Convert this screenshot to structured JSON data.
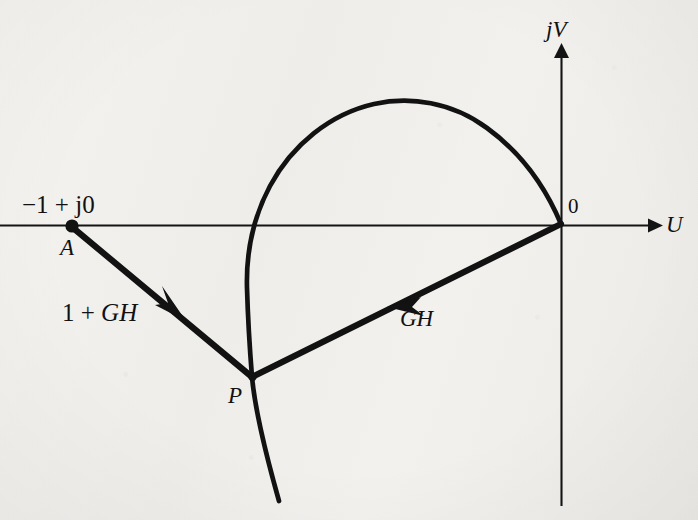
{
  "figure": {
    "kind": "nyquist-plot",
    "background_color": "#f1f0ed",
    "ink_color": "#111111"
  },
  "axes": {
    "horizontal": {
      "label": "U",
      "label_x": 666,
      "label_y": 213,
      "y": 225,
      "x_start": 0,
      "x_end": 656
    },
    "vertical": {
      "label": "jV",
      "label_x": 546,
      "label_y": 18,
      "x": 561,
      "y_start": 45,
      "y_end": 506
    },
    "origin": {
      "label": "0",
      "x": 561,
      "y": 225,
      "label_x": 568,
      "label_y": 196
    }
  },
  "points": [
    {
      "name": "point-a",
      "label": "A",
      "sub_label": "−1 + j0",
      "x": 72,
      "y": 226,
      "label_x": 60,
      "label_y": 236,
      "sub_label_x": 22,
      "sub_label_y": 192,
      "marker": "filled-dot"
    },
    {
      "name": "point-p",
      "label": "P",
      "x": 252,
      "y": 377,
      "label_x": 228,
      "label_y": 384,
      "marker": "vertex"
    }
  ],
  "vectors": [
    {
      "name": "vector-one-plus-gh",
      "label": "1 + GH",
      "label_plain": "1 + ",
      "label_italic": "GH",
      "from_x": 72,
      "from_y": 227,
      "to_x": 252,
      "to_y": 377,
      "arrow_x": 177,
      "arrow_y": 314,
      "label_x": 62,
      "label_y": 300
    },
    {
      "name": "vector-gh",
      "label": "GH",
      "from_x": 561,
      "from_y": 224,
      "to_x": 252,
      "to_y": 377,
      "arrow_x": 398,
      "arrow_y": 300,
      "label_x": 400,
      "label_y": 307
    }
  ],
  "curve": {
    "name": "nyquist-locus",
    "description": "GH locus arcing from origin counter-clockwise through upper half plane, crossing the negative real axis and descending through P",
    "crossing_real_axis_x": 258,
    "peak_x": 415,
    "peak_y": 104,
    "leftmost_x": 247,
    "tail_end_x": 279,
    "tail_end_y": 501,
    "stroke_width": 4.6
  },
  "style": {
    "axis_stroke_width": 2,
    "vector_stroke_width": 6
  }
}
